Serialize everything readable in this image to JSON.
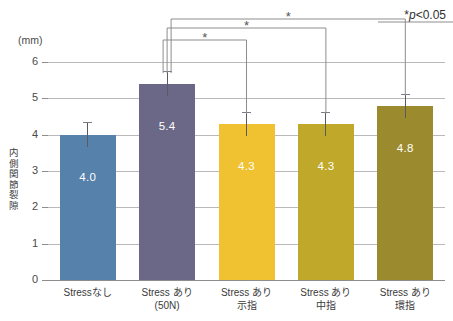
{
  "chart_data": {
    "type": "bar",
    "title": "",
    "xlabel": "",
    "ylabel": "内側関節裂隙",
    "yunit": "(mm)",
    "ylim": [
      0,
      6
    ],
    "grid": true,
    "ytick_labels": [
      "6",
      "5",
      "4",
      "3",
      "2",
      "1",
      "0"
    ],
    "yticks": [
      6,
      5,
      4,
      3,
      2,
      1,
      0
    ],
    "categories": [
      {
        "line1": "Stressなし",
        "line2": ""
      },
      {
        "line1": "Stress あり",
        "line2": "(50N)"
      },
      {
        "line1": "Stress あり",
        "line2": "示指"
      },
      {
        "line1": "Stress あり",
        "line2": "中指"
      },
      {
        "line1": "Stress あり",
        "line2": "環指"
      }
    ],
    "values": [
      4.0,
      5.4,
      4.3,
      4.3,
      4.8
    ],
    "value_labels": [
      "4.0",
      "5.4",
      "4.3",
      "4.3",
      "4.8"
    ],
    "error_upper": [
      0.35,
      0.35,
      0.33,
      0.33,
      0.33
    ],
    "colors": [
      "#5681ab",
      "#6b6787",
      "#f0c231",
      "#c0a82b",
      "#9c8a2e"
    ],
    "annotations": {
      "p_note_star": "*",
      "p_note_p": "p",
      "p_note_rest": "<0.05",
      "significance_marker": "*",
      "brackets": [
        {
          "from": 1,
          "to": 2,
          "marker": "*"
        },
        {
          "from": 1,
          "to": 3,
          "marker": "*"
        },
        {
          "from": 1,
          "to": 4,
          "marker": "*"
        }
      ]
    },
    "legend": null,
    "legend_position": "none"
  }
}
